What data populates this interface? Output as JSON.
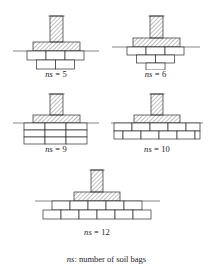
{
  "figure": {
    "note": {
      "symbol": "ns",
      "separator": ": ",
      "text": "number of soil bags"
    },
    "colors": {
      "line": "#2b2b2b",
      "thin_line": "#4a4a4a",
      "ground_line": "#555555",
      "bag_fill": "#ffffff",
      "background": "#ffffff"
    },
    "panels": [
      {
        "id": "panel-ns-5",
        "label_symbol": "ns",
        "label_equals": " = ",
        "label_value": "5",
        "caption": "ns = 5",
        "bag_count": 5,
        "arrangement": "inverted-pyramid",
        "rows": [
          {
            "count": 3,
            "offset": 0
          },
          {
            "count": 2,
            "offset": 1
          }
        ]
      },
      {
        "id": "panel-ns-6",
        "label_symbol": "ns",
        "label_equals": " = ",
        "label_value": "6",
        "caption": "ns = 6",
        "bag_count": 6,
        "arrangement": "inverted-pyramid",
        "rows": [
          {
            "count": 3,
            "offset": 0
          },
          {
            "count": 2,
            "offset": 1
          },
          {
            "count": 1,
            "offset": 2
          }
        ]
      },
      {
        "id": "panel-ns-9",
        "label_symbol": "ns",
        "label_equals": " = ",
        "label_value": "9",
        "caption": "ns = 9",
        "bag_count": 9,
        "arrangement": "stacked-grid",
        "rows": [
          {
            "count": 3,
            "offset": 0
          },
          {
            "count": 3,
            "offset": 0
          },
          {
            "count": 3,
            "offset": 0
          }
        ]
      },
      {
        "id": "panel-ns-10",
        "label_symbol": "ns",
        "label_equals": " = ",
        "label_value": "10",
        "caption": "ns = 10",
        "bag_count": 10,
        "arrangement": "staggered-courses",
        "rows": [
          {
            "count": 5,
            "offset": 0
          },
          {
            "count": 5,
            "offset": 0.5
          }
        ]
      },
      {
        "id": "panel-ns-12",
        "label_symbol": "ns",
        "label_equals": " = ",
        "label_value": "12",
        "caption": "ns = 12",
        "bag_count": 12,
        "arrangement": "pyramid-staggered",
        "rows": [
          {
            "count": 5,
            "offset": 0.5
          },
          {
            "count": 6,
            "offset": 0
          }
        ]
      }
    ],
    "components": {
      "column_label": "column",
      "footing_label": "footing",
      "ground_label": "ground-surface",
      "bag_label": "soil-bag"
    }
  }
}
